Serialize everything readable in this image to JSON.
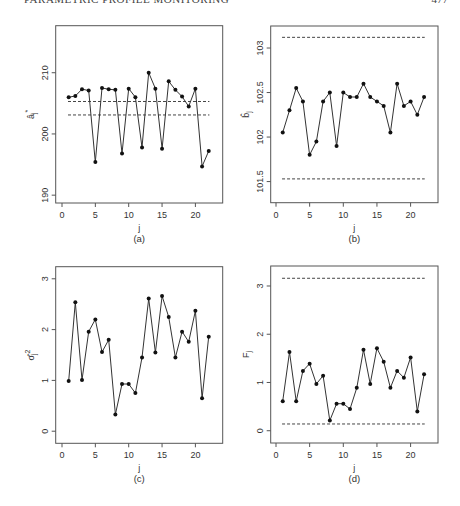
{
  "page": {
    "running_head": "PARAMETRIC PROFILE MONITORING",
    "page_number": "477"
  },
  "chart_data": [
    {
      "id": "a",
      "type": "line",
      "caption": "(a)",
      "xlabel": "j",
      "ylabel": "â_j*",
      "ylabel_main": "a",
      "ylabel_sub": "j",
      "ylabel_sup": "*",
      "xlim": [
        0,
        23
      ],
      "ylim": [
        189.7,
        216.7
      ],
      "xticks": [
        0,
        5,
        10,
        15,
        20
      ],
      "yticks": [
        190,
        200,
        210
      ],
      "grid": false,
      "x": [
        1,
        2,
        3,
        4,
        5,
        6,
        7,
        8,
        9,
        10,
        11,
        12,
        13,
        14,
        15,
        16,
        17,
        18,
        19,
        20,
        21,
        22
      ],
      "values": [
        206.0,
        206.2,
        207.3,
        207.1,
        195.4,
        207.5,
        207.3,
        207.2,
        196.8,
        207.4,
        206.0,
        197.8,
        210.0,
        207.4,
        197.6,
        208.6,
        207.2,
        206.1,
        204.5,
        207.4,
        194.7,
        197.2
      ],
      "control_limits": [
        205.3,
        203.1
      ]
    },
    {
      "id": "b",
      "type": "line",
      "caption": "(b)",
      "xlabel": "j",
      "ylabel": "b̂_j",
      "ylabel_main": "b",
      "ylabel_sub": "j",
      "ylabel_sup": "",
      "xlim": [
        0,
        23
      ],
      "ylim": [
        101.33,
        103.18
      ],
      "xticks": [
        0,
        5,
        10,
        15,
        20
      ],
      "yticks": [
        101.5,
        102,
        102.5,
        103
      ],
      "grid": false,
      "x": [
        1,
        2,
        3,
        4,
        5,
        6,
        7,
        8,
        9,
        10,
        11,
        12,
        13,
        14,
        15,
        16,
        17,
        18,
        19,
        20,
        21,
        22
      ],
      "values": [
        102.05,
        102.3,
        102.55,
        102.4,
        101.8,
        101.95,
        102.4,
        102.5,
        101.9,
        102.5,
        102.45,
        102.45,
        102.6,
        102.45,
        102.4,
        102.35,
        102.05,
        102.6,
        102.35,
        102.4,
        102.25,
        102.45
      ],
      "control_limits": [
        103.12,
        101.53
      ]
    },
    {
      "id": "c",
      "type": "line",
      "caption": "(c)",
      "xlabel": "j",
      "ylabel": "σ̂_j²",
      "ylabel_main": "σ",
      "ylabel_sub": "j",
      "ylabel_sup": "2",
      "xlim": [
        0,
        23
      ],
      "ylim": [
        -0.12,
        3.12
      ],
      "xticks": [
        0,
        5,
        10,
        15,
        20
      ],
      "yticks": [
        0,
        1,
        2,
        3
      ],
      "grid": false,
      "x": [
        1,
        2,
        3,
        4,
        5,
        6,
        7,
        8,
        9,
        10,
        11,
        12,
        13,
        14,
        15,
        16,
        17,
        18,
        19,
        20,
        21,
        22
      ],
      "values": [
        0.99,
        2.54,
        1.01,
        1.96,
        2.2,
        1.56,
        1.8,
        0.33,
        0.93,
        0.93,
        0.75,
        1.45,
        2.61,
        1.55,
        2.66,
        2.25,
        1.45,
        1.96,
        1.76,
        2.37,
        0.65,
        1.86
      ],
      "control_limits": []
    },
    {
      "id": "d",
      "type": "line",
      "caption": "(d)",
      "xlabel": "j",
      "ylabel": "F_j",
      "ylabel_main": "F",
      "ylabel_sub": "j",
      "ylabel_sup": "",
      "xlim": [
        0,
        23
      ],
      "ylim": [
        -0.13,
        3.29
      ],
      "xticks": [
        0,
        5,
        10,
        15,
        20
      ],
      "yticks": [
        0,
        1,
        2,
        3
      ],
      "grid": false,
      "x": [
        1,
        2,
        3,
        4,
        5,
        6,
        7,
        8,
        9,
        10,
        11,
        12,
        13,
        14,
        15,
        16,
        17,
        18,
        19,
        20,
        21,
        22
      ],
      "values": [
        0.61,
        1.63,
        0.61,
        1.24,
        1.39,
        0.97,
        1.14,
        0.21,
        0.56,
        0.56,
        0.45,
        0.89,
        1.68,
        0.97,
        1.71,
        1.43,
        0.89,
        1.24,
        1.1,
        1.52,
        0.4,
        1.17
      ],
      "control_limits": [
        3.16,
        0.14
      ]
    }
  ],
  "layout": {
    "panels": [
      {
        "left": 55.7,
        "top": 25.7,
        "right": 222.7,
        "bottom": 203,
        "x0px": 62,
        "xunit": 6.67,
        "ticky0": 197,
        "ticky_ref": [
          190,
          65,
          210
        ]
      },
      {
        "left": 270.7,
        "top": 26,
        "right": 438,
        "bottom": 202.7,
        "x0px": 276,
        "xunit": 6.73
      },
      {
        "left": 55.7,
        "top": 266.7,
        "right": 222.7,
        "bottom": 443.3,
        "x0px": 62,
        "xunit": 6.67
      },
      {
        "left": 270.7,
        "top": 266,
        "right": 438,
        "bottom": 443,
        "x0px": 276,
        "xunit": 6.73
      }
    ],
    "colors": {
      "line": "#333333",
      "point": "#111111",
      "axis": "#555555",
      "limit": "#444444"
    }
  }
}
